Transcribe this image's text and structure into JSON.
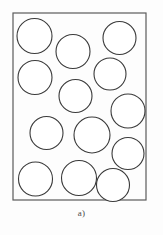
{
  "figure": {
    "caption": "a)",
    "panel_label": "a)",
    "colors": {
      "background": "#fdfdfd",
      "frame_stroke": "#5b5b5b",
      "circle_stroke": "#3a3a3a",
      "circle_fill": "#ffffff",
      "caption_text": "#4a4a4a"
    },
    "frame": {
      "x": 13,
      "y": 13,
      "width": 133,
      "height": 187,
      "stroke_width": 1.2
    },
    "circle_stroke_width": 1.1,
    "circle_count": 14,
    "circles": [
      {
        "id": 1,
        "cx": 34.5,
        "cy": 36.0,
        "r": 17.5
      },
      {
        "id": 2,
        "cx": 73.0,
        "cy": 51.5,
        "r": 17.0
      },
      {
        "id": 3,
        "cx": 119.5,
        "cy": 38.0,
        "r": 16.5
      },
      {
        "id": 4,
        "cx": 35.0,
        "cy": 77.5,
        "r": 17.0
      },
      {
        "id": 5,
        "cx": 110.0,
        "cy": 74.0,
        "r": 16.0
      },
      {
        "id": 6,
        "cx": 75.5,
        "cy": 96.0,
        "r": 16.5
      },
      {
        "id": 7,
        "cx": 128.0,
        "cy": 111.0,
        "r": 17.0
      },
      {
        "id": 8,
        "cx": 46.5,
        "cy": 133.0,
        "r": 16.5
      },
      {
        "id": 9,
        "cx": 92.0,
        "cy": 135.0,
        "r": 18.0
      },
      {
        "id": 10,
        "cx": 128.0,
        "cy": 153.5,
        "r": 16.0
      },
      {
        "id": 11,
        "cx": 35.5,
        "cy": 179.0,
        "r": 17.0
      },
      {
        "id": 12,
        "cx": 79.0,
        "cy": 178.0,
        "r": 17.5
      },
      {
        "id": 13,
        "cx": 113.0,
        "cy": 185.0,
        "r": 16.5
      },
      {
        "id": 14,
        "cx": 60.0,
        "cy": 108.0,
        "r": 0.0
      }
    ]
  }
}
